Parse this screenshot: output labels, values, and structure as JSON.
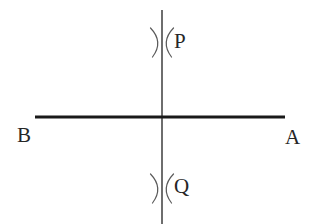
{
  "figure": {
    "kind": "geometry-construction-diagram",
    "background_color": "#ffffff",
    "ink_color": "#262626",
    "labels": {
      "left_endpoint": "B",
      "right_endpoint": "A",
      "upper_arc_intersection": "P",
      "lower_arc_intersection": "Q"
    },
    "lines": {
      "horizontal": {
        "name": "line-BA",
        "x1": 35,
        "y1": 117,
        "x2": 285,
        "y2": 117,
        "stroke_width": 3.2,
        "color": "#1a1a1a"
      },
      "vertical": {
        "name": "line-PQ",
        "x1": 162,
        "y1": 10,
        "x2": 162,
        "y2": 224,
        "stroke_width": 1.6,
        "color": "#4a4a4a"
      }
    },
    "arc_marks": [
      {
        "name": "arc-cross-P",
        "center_x": 162,
        "center_y": 42,
        "half_width": 11,
        "half_height": 15,
        "stroke_width": 1.2,
        "color": "#5a5a5a"
      },
      {
        "name": "arc-cross-Q",
        "center_x": 162,
        "center_y": 188,
        "half_width": 11,
        "half_height": 15,
        "stroke_width": 1.2,
        "color": "#5a5a5a"
      }
    ],
    "intersection_point": {
      "x": 162,
      "y": 117
    }
  }
}
